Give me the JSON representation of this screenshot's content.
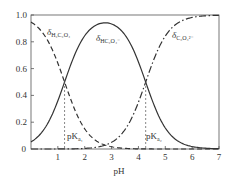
{
  "chart_data": {
    "type": "line",
    "title": "",
    "xlabel": "pH",
    "ylabel": "",
    "xlim": [
      0,
      7
    ],
    "ylim": [
      0,
      1.0
    ],
    "x_ticks": [
      "1",
      "2",
      "3",
      "4",
      "5",
      "6",
      "7"
    ],
    "y_ticks": [
      "0",
      "0.2",
      "0.4",
      "0.6",
      "0.8",
      "1.0"
    ],
    "grid": false,
    "legend": "inline labels",
    "pKa1": 1.25,
    "pKa2": 4.27,
    "x": [
      0,
      0.5,
      1.0,
      1.25,
      1.5,
      2.0,
      2.5,
      2.76,
      3.0,
      3.5,
      4.0,
      4.27,
      4.5,
      5.0,
      5.5,
      6.0,
      7.0
    ],
    "series": [
      {
        "name": "δ H2C2O4",
        "style": "dashed",
        "values": [
          0.95,
          0.85,
          0.64,
          0.5,
          0.36,
          0.15,
          0.05,
          0.03,
          0.02,
          0.0,
          0.0,
          0.0,
          0.0,
          0.0,
          0.0,
          0.0,
          0.0
        ]
      },
      {
        "name": "δ HC2O4-",
        "style": "solid",
        "values": [
          0.05,
          0.15,
          0.36,
          0.5,
          0.63,
          0.83,
          0.9,
          0.94,
          0.92,
          0.85,
          0.65,
          0.5,
          0.37,
          0.16,
          0.06,
          0.02,
          0.0
        ]
      },
      {
        "name": "δ C2O4 2-",
        "style": "dash-dot",
        "values": [
          0.0,
          0.0,
          0.0,
          0.0,
          0.0,
          0.01,
          0.05,
          0.03,
          0.06,
          0.15,
          0.35,
          0.5,
          0.63,
          0.84,
          0.94,
          0.98,
          1.0
        ]
      }
    ],
    "annotations": [
      {
        "text": "pKa1",
        "x": 1.25
      },
      {
        "text": "pKa2",
        "x": 4.27
      }
    ]
  },
  "labels": {
    "xlabel": "pH",
    "delta": "δ",
    "h2c2o4_sub": "H₂C₂O₄",
    "hc2o4_sub": "HC₂O₄⁻",
    "c2o4_sub": "C₂O₄²⁻",
    "pka1_p": "pK",
    "pka1_sub": "a₁",
    "pka2_p": "pK",
    "pka2_sub": "a₂"
  }
}
